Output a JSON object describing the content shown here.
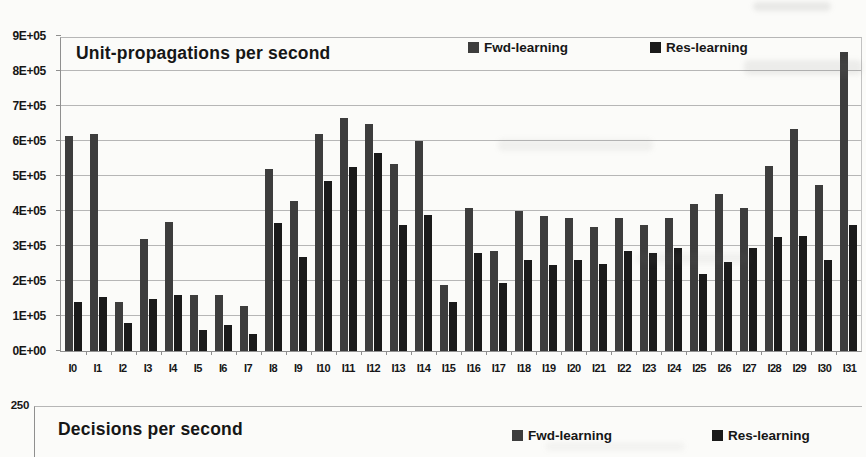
{
  "chart_data": [
    {
      "type": "bar",
      "title": "Unit-propagations per second",
      "categories": [
        "I0",
        "I1",
        "I2",
        "I3",
        "I4",
        "I5",
        "I6",
        "I7",
        "I8",
        "I9",
        "I10",
        "I11",
        "I12",
        "I13",
        "I14",
        "I15",
        "I16",
        "I17",
        "I18",
        "I19",
        "I20",
        "I21",
        "I22",
        "I23",
        "I24",
        "I25",
        "I26",
        "I27",
        "I28",
        "I29",
        "I30",
        "I31"
      ],
      "series": [
        {
          "name": "Fwd-learning",
          "color": "#3d3d3d",
          "values": [
            615000,
            620000,
            140000,
            320000,
            370000,
            160000,
            160000,
            130000,
            520000,
            430000,
            620000,
            665000,
            650000,
            535000,
            600000,
            190000,
            410000,
            285000,
            400000,
            385000,
            380000,
            355000,
            380000,
            360000,
            380000,
            420000,
            450000,
            410000,
            530000,
            635000,
            475000,
            855000
          ]
        },
        {
          "name": "Res-learning",
          "color": "#1a1a1a",
          "values": [
            140000,
            155000,
            80000,
            150000,
            160000,
            60000,
            75000,
            50000,
            365000,
            270000,
            485000,
            525000,
            565000,
            360000,
            390000,
            140000,
            280000,
            195000,
            260000,
            245000,
            260000,
            250000,
            285000,
            280000,
            295000,
            220000,
            255000,
            295000,
            325000,
            330000,
            260000,
            360000
          ]
        }
      ],
      "ylim": [
        0,
        900000
      ],
      "ytick_step": 100000,
      "ytick_labels": [
        "0E+00",
        "1E+05",
        "2E+05",
        "3E+05",
        "4E+05",
        "5E+05",
        "6E+05",
        "7E+05",
        "8E+05",
        "9E+05"
      ],
      "grid": true,
      "legend_position": "top-right-inside"
    },
    {
      "type": "bar",
      "title": "Decisions per second",
      "series": [
        {
          "name": "Fwd-learning",
          "color": "#3d3d3d"
        },
        {
          "name": "Res-learning",
          "color": "#1a1a1a"
        }
      ],
      "ytick_labels_visible": [
        "250"
      ],
      "grid": true,
      "legend_position": "top-right-inside",
      "layout_note": "chart is cropped by the bottom edge of the image; only the top gridline, title and legend are visible"
    }
  ]
}
